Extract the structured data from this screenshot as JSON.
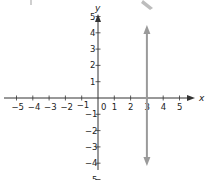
{
  "chart_data": {
    "type": "line",
    "title": "",
    "xlabel": "x",
    "ylabel": "y",
    "xlim": [
      -5,
      5
    ],
    "ylim": [
      -5,
      5
    ],
    "grid": false,
    "x_ticks": [
      -5,
      -4,
      -3,
      -2,
      -1,
      0,
      1,
      2,
      3,
      4,
      5
    ],
    "y_ticks": [
      -5,
      -4,
      -3,
      -2,
      -1,
      1,
      2,
      3,
      4,
      5
    ],
    "x_tick_labels": [
      "−5",
      "−4",
      "−3",
      "−2",
      "−1",
      "0",
      "1",
      "2",
      "3",
      "4",
      "5"
    ],
    "y_tick_labels": [
      "−5",
      "−4",
      "−3",
      "−2",
      "−1",
      "1",
      "2",
      "3",
      "4",
      "5"
    ],
    "origin_label": "0",
    "series": [
      {
        "name": "x = 3",
        "kind": "vertical-line",
        "x": 3,
        "y_range": [
          -5.2,
          5.2
        ],
        "arrows": "both",
        "color": "#9a9a9a"
      }
    ]
  },
  "colors": {
    "axis": "#333333",
    "line": "#9a9a9a",
    "text": "#222222",
    "background": "#ffffff"
  }
}
